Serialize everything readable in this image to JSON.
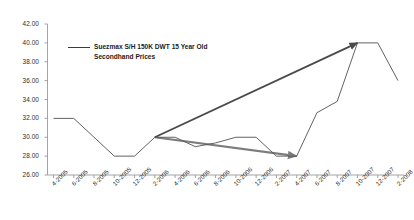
{
  "chart_data": {
    "type": "line",
    "title": "",
    "xlabel": "",
    "ylabel": "",
    "ylim": [
      26.0,
      42.0
    ],
    "ytick_step": 2.0,
    "grid": false,
    "legend_position": "top-left-inside",
    "ytick_labels": [
      "42.00",
      "40.00",
      "38.00",
      "36.00",
      "34.00",
      "32.00",
      "30.00",
      "28.00",
      "26.00"
    ],
    "ytick_values": [
      42.0,
      40.0,
      38.0,
      36.0,
      34.0,
      32.0,
      30.0,
      28.0,
      26.0
    ],
    "categories": [
      "4-2005",
      "6-2005",
      "8-2005",
      "10-2005",
      "12-2005",
      "2-2006",
      "4-2006",
      "6-2006",
      "8-2006",
      "10-2006",
      "12-2006",
      "2-2007",
      "4-2007",
      "6-2007",
      "8-2007",
      "10-2007",
      "12-2007",
      "2-2008"
    ],
    "series": [
      {
        "name": "Suezmax S/H 150K DWT 15 Year Old Secondhand Prices",
        "color": "#5a5a5a",
        "values": [
          32.0,
          32.0,
          30.0,
          28.0,
          28.0,
          30.0,
          30.0,
          29.0,
          29.4,
          30.0,
          30.0,
          28.0,
          28.0,
          32.6,
          33.8,
          40.0,
          40.0,
          36.0
        ]
      }
    ],
    "annotations": [
      {
        "name": "downward-trend-arrow",
        "type": "arrow",
        "color": "#7d7d7d",
        "from": {
          "x": "2-2006",
          "y": 30.0
        },
        "to": {
          "x": "4-2007",
          "y": 28.0
        }
      },
      {
        "name": "upward-trend-arrow",
        "type": "arrow",
        "color": "#4a4a4a",
        "from": {
          "x": "2-2006",
          "y": 30.0
        },
        "to": {
          "x": "10-2007",
          "y": 40.0
        }
      }
    ]
  },
  "legend": {
    "label": "Suezmax S/H 150K DWT 15 Year Old Secondhand Prices",
    "swatch_color": "#3a3a3a"
  },
  "axes": {
    "axis_color": "#9a9a9a",
    "tick_color": "#9a9a9a",
    "label_color": "#2b2b2b"
  }
}
